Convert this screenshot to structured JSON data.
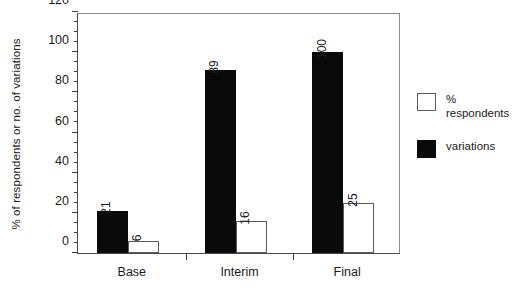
{
  "chart_data": {
    "type": "bar",
    "title": "",
    "xlabel": "",
    "ylabel": "% of respondents or no. of variations",
    "ylim": [
      0,
      120
    ],
    "ytick_step": 20,
    "yminor_step": 5,
    "grid": false,
    "legend_position": "right",
    "categories": [
      "Base",
      "Interim",
      "Final"
    ],
    "series": [
      {
        "name": "variations",
        "style": "filled",
        "color": "#0a0a0a",
        "values": [
          21,
          89,
          100
        ]
      },
      {
        "name": "% respondents",
        "style": "open",
        "color": "#ffffff",
        "values": [
          6,
          16,
          25
        ]
      }
    ],
    "ytick_labels": [
      "0",
      "20",
      "40",
      "60",
      "80",
      "100",
      "120"
    ],
    "data_labels": [
      [
        "21",
        "6"
      ],
      [
        "89",
        "16"
      ],
      [
        "100",
        "25"
      ]
    ]
  },
  "axis": {
    "y_title": "% of respondents or no. of variations",
    "y_ticks": [
      {
        "value": 120,
        "label": "120"
      },
      {
        "value": 100,
        "label": "100"
      },
      {
        "value": 80,
        "label": "80"
      },
      {
        "value": 60,
        "label": "60"
      },
      {
        "value": 40,
        "label": "40"
      },
      {
        "value": 20,
        "label": "20"
      },
      {
        "value": 0,
        "label": "0"
      }
    ],
    "x_categories": [
      {
        "label": "Base"
      },
      {
        "label": "Interim"
      },
      {
        "label": "Final"
      }
    ]
  },
  "legend": {
    "entries": [
      {
        "label": "% respondents",
        "swatch": "open"
      },
      {
        "label": "variations",
        "swatch": "filled"
      }
    ]
  }
}
